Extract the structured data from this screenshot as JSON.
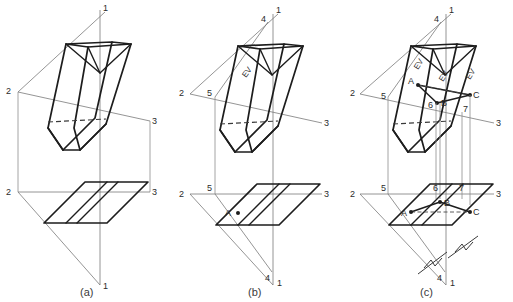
{
  "figure": {
    "panels": [
      {
        "key": "a",
        "caption": "(a)",
        "description": "Front (vertical) view of oblique prism above, top (horizontal) view below, with fold lines 1-2-3",
        "fold_labels": [
          "1",
          "2",
          "3",
          "2",
          "3",
          "1"
        ]
      },
      {
        "key": "b",
        "caption": "(b)",
        "description": "Auxiliary reference line 4-5 added; point A located; edge view line labelled EV",
        "fold_labels": [
          "4",
          "1",
          "2",
          "5",
          "3",
          "2",
          "5",
          "3",
          "4",
          "1"
        ],
        "point_labels": [
          "A"
        ],
        "ev_labels": [
          "EV"
        ]
      },
      {
        "key": "c",
        "caption": "(c)",
        "description": "Completed construction: points A, B, C and auxiliary lines 5, 6, 7 projected between views; three edge-view lines labelled EV; equal-distance tick marks shown",
        "fold_labels": [
          "4",
          "1",
          "2",
          "5",
          "3",
          "2",
          "5",
          "3",
          "4",
          "1"
        ],
        "point_labels": [
          "A",
          "B",
          "C"
        ],
        "aux_labels": [
          "5",
          "6",
          "7"
        ],
        "ev_labels": [
          "EV",
          "EV",
          "EV"
        ]
      }
    ],
    "labels": {
      "one": "1",
      "two": "2",
      "three": "3",
      "four": "4",
      "five": "5",
      "six": "6",
      "seven": "7",
      "a_point": "A",
      "b_point": "B",
      "c_point": "C",
      "ev": "EV"
    },
    "colors": {
      "line_dark": "#1d1d1d",
      "line_thin": "#7a7a7a",
      "hidden": "#3a3a3a",
      "text": "#2b2b2b",
      "background": "#ffffff"
    }
  }
}
